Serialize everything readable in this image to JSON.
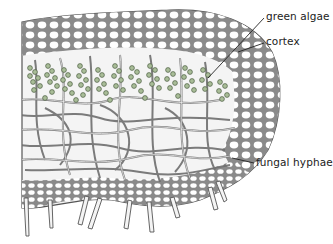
{
  "diagram": {
    "labels": [
      {
        "id": "green-algae",
        "text": "green algae",
        "x": 266,
        "y": 10,
        "pointer": {
          "x1": 264,
          "y1": 18,
          "x2": 208,
          "y2": 78
        }
      },
      {
        "id": "cortex",
        "text": "cortex",
        "x": 266,
        "y": 35,
        "pointer": {
          "x1": 264,
          "y1": 43,
          "x2": 238,
          "y2": 52
        }
      },
      {
        "id": "fungal-hyphae",
        "text": "fungal hyphae",
        "x": 256,
        "y": 156,
        "pointer": {
          "x1": 254,
          "y1": 163,
          "x2": 232,
          "y2": 158
        }
      }
    ],
    "colors": {
      "tissue": "#8a8a8a",
      "tissue_dark": "#5a5a5a",
      "algae": "#a9bd98",
      "algae_outline": "#4e5e44",
      "background": "#ffffff"
    }
  }
}
